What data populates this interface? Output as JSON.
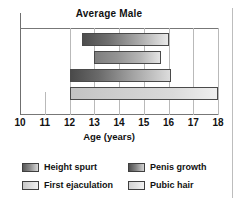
{
  "chart_data": {
    "type": "bar",
    "orientation": "horizontal",
    "title": "Average Male",
    "xlabel": "Age (years)",
    "ylabel": "",
    "xlim": [
      10,
      18
    ],
    "xticks": [
      "10",
      "11",
      "12",
      "13",
      "14",
      "15",
      "16",
      "17",
      "18"
    ],
    "grid": true,
    "legend_position": "below",
    "categories": [
      "Height spurt",
      "Penis growth",
      "First ejaculation",
      "Pubic hair"
    ],
    "bars": [
      {
        "label": "Height spurt",
        "start": 12.5,
        "end": 16.0,
        "shade": "dark"
      },
      {
        "label": "Penis growth",
        "start": 13.0,
        "end": 15.7,
        "shade": "mid"
      },
      {
        "label": "First ejaculation",
        "start": 12.0,
        "end": 16.1,
        "shade": "dark2"
      },
      {
        "label": "Pubic hair",
        "start": 12.0,
        "end": 18.0,
        "shade": "light"
      }
    ]
  },
  "chart": {
    "title": "Average Male",
    "xlabel": "Age (years)",
    "ticks": [
      "10",
      "11",
      "12",
      "13",
      "14",
      "15",
      "16",
      "17",
      "18"
    ]
  },
  "legend": {
    "items": [
      {
        "label": "Height spurt",
        "swatch": "legend-swatch-height-spurt"
      },
      {
        "label": "Penis growth",
        "swatch": "legend-swatch-penis-growth"
      },
      {
        "label": "First ejaculation",
        "swatch": "legend-swatch-first-ejaculation"
      },
      {
        "label": "Pubic hair",
        "swatch": "legend-swatch-pubic-hair"
      }
    ]
  },
  "colors": {
    "bar_border": "#4a4a4a",
    "gridline": "#b9b9b9",
    "axis": "#777777",
    "text": "#111111",
    "background": "#ffffff"
  }
}
